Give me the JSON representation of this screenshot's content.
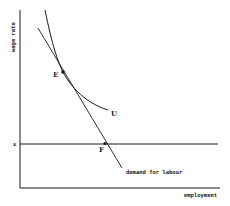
{
  "diagram": {
    "y_axis_label": "wage rate",
    "x_axis_label": "employment",
    "wage_level_label": "x",
    "point_E_label": "E",
    "point_F_label": "F",
    "indifference_curve_label": "U",
    "demand_curve_label": "demand for labour",
    "line_color": "#1a1a1a",
    "background": "#ffffff"
  }
}
